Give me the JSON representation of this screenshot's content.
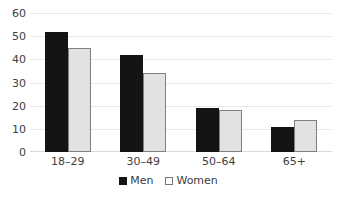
{
  "chart_data": {
    "type": "bar",
    "title": "",
    "xlabel": "",
    "ylabel": "",
    "categories": [
      "18–29",
      "30–49",
      "50–64",
      "65+"
    ],
    "series": [
      {
        "name": "Men",
        "values": [
          52,
          42,
          19,
          11
        ],
        "color": "#141414"
      },
      {
        "name": "Women",
        "values": [
          45,
          34,
          18,
          14
        ],
        "color": "#e2e2e2"
      }
    ],
    "ylim": [
      0,
      60
    ],
    "yticks": [
      0,
      10,
      20,
      30,
      40,
      50,
      60
    ],
    "ytick_labels": [
      "0",
      "10",
      "20",
      "30",
      "40",
      "50",
      "60"
    ],
    "grid": true,
    "grid_axis": "y",
    "legend": true,
    "legend_position": "bottom"
  },
  "legend": {
    "items": [
      {
        "label": "Men",
        "marker": "filled-square-marker"
      },
      {
        "label": "Women",
        "marker": "outlined-square-marker"
      }
    ]
  },
  "artifacts": {
    "bottom_caption_fragment": ""
  }
}
